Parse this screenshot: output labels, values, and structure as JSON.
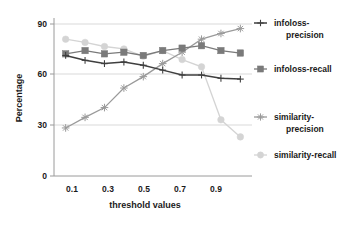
{
  "chart_data": {
    "type": "line",
    "title": "",
    "xlabel": "threshold values",
    "ylabel": "Percentage",
    "x": [
      0.1,
      0.2,
      0.3,
      0.4,
      0.5,
      0.6,
      0.7,
      0.8,
      0.9,
      1.0
    ],
    "xticks": [
      "0.1",
      "0.3",
      "0.5",
      "0.7",
      "0.9"
    ],
    "xtick_values": [
      0.1,
      0.3,
      0.5,
      0.7,
      0.9
    ],
    "yticks": [
      "0",
      "30",
      "60",
      "90"
    ],
    "ytick_values": [
      0,
      30,
      60,
      90
    ],
    "ylim": [
      0,
      97
    ],
    "xlim": [
      0.04,
      1.06
    ],
    "grid": "horizontal",
    "legend_position": "right",
    "series": [
      {
        "name": "infoloss-precision",
        "color": "#3f3f3f",
        "marker": "plus",
        "values": [
          74,
          71,
          69,
          70,
          68,
          65,
          62,
          62,
          60,
          59.5
        ]
      },
      {
        "name": "infoloss-recall",
        "color": "#7a7a7a",
        "marker": "square",
        "values": [
          75,
          77,
          75,
          76,
          74,
          77,
          78.5,
          80,
          77,
          75.5
        ]
      },
      {
        "name": "similarity-precision",
        "color": "#9a9a9a",
        "marker": "star",
        "values": [
          29.5,
          36,
          42,
          54,
          61,
          69,
          76,
          84,
          87.5,
          90.5
        ]
      },
      {
        "name": "similarity-recall",
        "color": "#d4d4d4",
        "marker": "circle",
        "values": [
          84,
          82,
          79.5,
          78,
          73.5,
          77,
          71.5,
          67,
          34.5,
          24
        ]
      }
    ]
  },
  "legend": {
    "items": [
      {
        "label_line1": "infoloss-",
        "label_line2": "precision"
      },
      {
        "label_line1": "infoloss-recall",
        "label_line2": ""
      },
      {
        "label_line1": "similarity-",
        "label_line2": "precision"
      },
      {
        "label_line1": "similarity-recall",
        "label_line2": ""
      }
    ]
  }
}
